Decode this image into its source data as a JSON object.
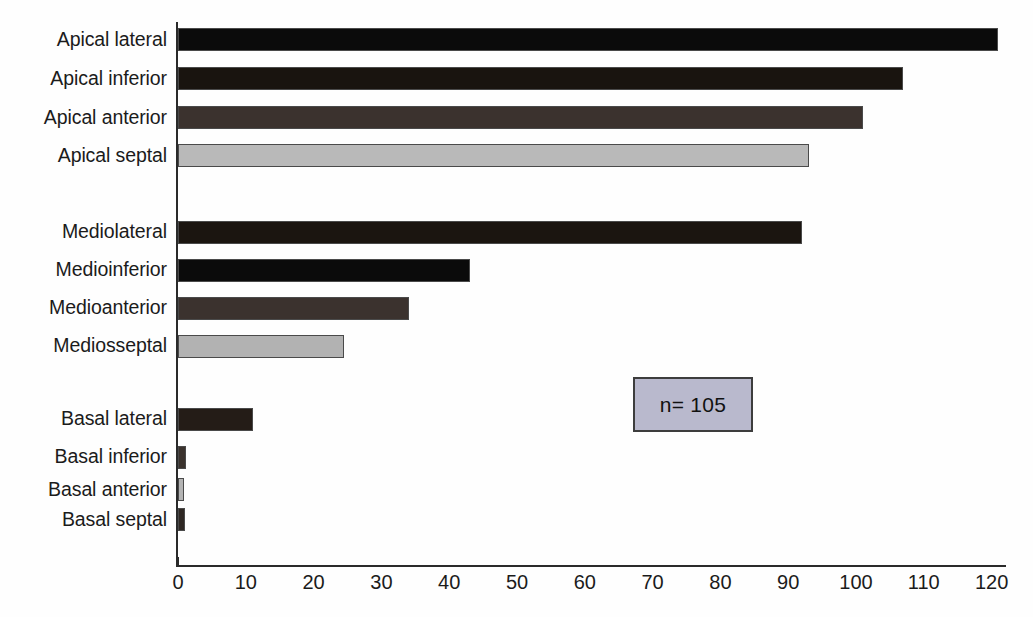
{
  "chart_data": {
    "type": "bar",
    "orientation": "horizontal",
    "title": "",
    "subtitle": "",
    "xlabel": "",
    "ylabel": "",
    "xlim": [
      0,
      124
    ],
    "ylim": null,
    "grid": false,
    "legend": null,
    "xticks": [
      0,
      10,
      20,
      30,
      40,
      50,
      60,
      70,
      80,
      90,
      100,
      110,
      120
    ],
    "xticklabels": [
      "0",
      "10",
      "20",
      "30",
      "40",
      "50",
      "60",
      "70",
      "80",
      "90",
      "100",
      "110",
      "120"
    ],
    "categories": [
      "Apical lateral",
      "Apical inferior",
      "Apical anterior",
      "Apical septal",
      "Mediolateral",
      "Medioinferior",
      "Medioanterior",
      "Mediosseptal",
      "Basal lateral",
      "Basal inferior",
      "Basal anterior",
      "Basal septal"
    ],
    "values": [
      121,
      107,
      101,
      93,
      92,
      43,
      34,
      24.5,
      11,
      1.2,
      0.8,
      1
    ],
    "bar_colors": [
      "#0b0b0b",
      "#19140f",
      "#3b322e",
      "#b9b9b9",
      "#1b1510",
      "#0b0b0b",
      "#3b322e",
      "#b2b2b2",
      "#241c17",
      "#3a322d",
      "#b4b4b4",
      "#2e2723"
    ],
    "groups": [
      {
        "name": "Apical",
        "category_indices": [
          0,
          1,
          2,
          3
        ]
      },
      {
        "name": "Medio",
        "category_indices": [
          4,
          5,
          6,
          7
        ]
      },
      {
        "name": "Basal",
        "category_indices": [
          8,
          9,
          10,
          11
        ]
      }
    ],
    "annotations": [
      {
        "text": "n= 105",
        "box_fill": "#b9b9cd",
        "box_border": "#3d3d3d"
      }
    ]
  },
  "annotation": {
    "n_label": "n= 105"
  },
  "axis": {
    "line_color": "#2a2a2a"
  }
}
